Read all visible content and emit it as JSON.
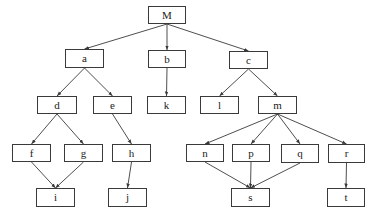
{
  "diagram": {
    "type": "tree-dag",
    "nodes": [
      {
        "id": "M",
        "label": "M",
        "x": 148,
        "y": 6,
        "w": 38,
        "h": 18
      },
      {
        "id": "a",
        "label": "a",
        "x": 65,
        "y": 49,
        "w": 39,
        "h": 19
      },
      {
        "id": "b",
        "label": "b",
        "x": 148,
        "y": 50,
        "w": 38,
        "h": 18
      },
      {
        "id": "c",
        "label": "c",
        "x": 229,
        "y": 51,
        "w": 39,
        "h": 18
      },
      {
        "id": "d",
        "label": "d",
        "x": 37,
        "y": 96,
        "w": 40,
        "h": 18
      },
      {
        "id": "e",
        "label": "e",
        "x": 93,
        "y": 96,
        "w": 39,
        "h": 18
      },
      {
        "id": "k",
        "label": "k",
        "x": 147,
        "y": 96,
        "w": 39,
        "h": 18
      },
      {
        "id": "l",
        "label": "l",
        "x": 200,
        "y": 96,
        "w": 39,
        "h": 18
      },
      {
        "id": "m",
        "label": "m",
        "x": 258,
        "y": 96,
        "w": 39,
        "h": 18
      },
      {
        "id": "f",
        "label": "f",
        "x": 12,
        "y": 144,
        "w": 39,
        "h": 18
      },
      {
        "id": "g",
        "label": "g",
        "x": 64,
        "y": 144,
        "w": 39,
        "h": 18
      },
      {
        "id": "h",
        "label": "h",
        "x": 112,
        "y": 144,
        "w": 39,
        "h": 18
      },
      {
        "id": "n",
        "label": "n",
        "x": 186,
        "y": 144,
        "w": 38,
        "h": 18
      },
      {
        "id": "p",
        "label": "p",
        "x": 232,
        "y": 144,
        "w": 38,
        "h": 18
      },
      {
        "id": "q",
        "label": "q",
        "x": 281,
        "y": 144,
        "w": 38,
        "h": 19
      },
      {
        "id": "r",
        "label": "r",
        "x": 328,
        "y": 144,
        "w": 37,
        "h": 19
      },
      {
        "id": "i",
        "label": "i",
        "x": 36,
        "y": 188,
        "w": 39,
        "h": 19
      },
      {
        "id": "j",
        "label": "j",
        "x": 108,
        "y": 188,
        "w": 39,
        "h": 19
      },
      {
        "id": "s",
        "label": "s",
        "x": 231,
        "y": 188,
        "w": 39,
        "h": 19
      },
      {
        "id": "t",
        "label": "t",
        "x": 327,
        "y": 188,
        "w": 38,
        "h": 19
      }
    ],
    "edges": [
      [
        "M",
        "a"
      ],
      [
        "M",
        "b"
      ],
      [
        "M",
        "c"
      ],
      [
        "a",
        "d"
      ],
      [
        "a",
        "e"
      ],
      [
        "b",
        "k"
      ],
      [
        "c",
        "l"
      ],
      [
        "c",
        "m"
      ],
      [
        "d",
        "f"
      ],
      [
        "d",
        "g"
      ],
      [
        "e",
        "h"
      ],
      [
        "m",
        "n"
      ],
      [
        "m",
        "p"
      ],
      [
        "m",
        "q"
      ],
      [
        "m",
        "r"
      ],
      [
        "f",
        "i"
      ],
      [
        "g",
        "i"
      ],
      [
        "h",
        "j"
      ],
      [
        "n",
        "s"
      ],
      [
        "p",
        "s"
      ],
      [
        "q",
        "s"
      ],
      [
        "r",
        "t"
      ]
    ],
    "colors": {
      "stroke": "#3a3a3a",
      "text": "#222222",
      "background": "#ffffff"
    }
  }
}
